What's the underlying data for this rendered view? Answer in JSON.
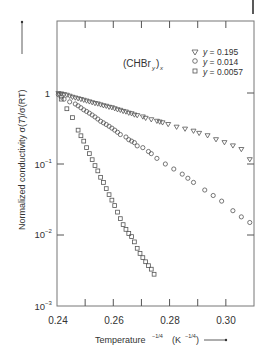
{
  "chart_data": {
    "type": "scatter",
    "title": "",
    "annotation": "(CHBr_y)_x",
    "xlabel": "Temperature^-1/4  (K^-1/4)",
    "ylabel": "Normalized conductivity σ(T)/σ(RT)",
    "xlim": [
      0.24,
      0.31
    ],
    "ylim": [
      0.001,
      3
    ],
    "yscale": "log",
    "x_ticks": [
      0.24,
      0.26,
      0.28,
      0.3
    ],
    "x_tick_labels": [
      "0.24",
      "0.26",
      "0.28",
      "0.30"
    ],
    "y_ticks": [
      1,
      0.1,
      0.01,
      0.001
    ],
    "y_tick_labels": [
      "1",
      "10⁻¹",
      "10⁻²",
      "10⁻³"
    ],
    "grid": false,
    "legend_position": "upper right",
    "series": [
      {
        "name": "y = 0.195",
        "marker": "triangle-down",
        "x": [
          0.2405,
          0.2415,
          0.2425,
          0.2435,
          0.2445,
          0.2455,
          0.2465,
          0.2475,
          0.2485,
          0.2495,
          0.2505,
          0.2515,
          0.2525,
          0.2535,
          0.2545,
          0.2555,
          0.2565,
          0.2575,
          0.2585,
          0.2595,
          0.2605,
          0.2615,
          0.2625,
          0.2635,
          0.2645,
          0.2655,
          0.2665,
          0.2675,
          0.2685,
          0.2705,
          0.2715,
          0.2735,
          0.2755,
          0.2765,
          0.2775,
          0.2795,
          0.2825,
          0.2855,
          0.2885,
          0.2905,
          0.2935,
          0.2965,
          0.2995,
          0.3025,
          0.3055,
          0.3085
        ],
        "y": [
          0.98,
          0.97,
          0.95,
          0.93,
          0.9,
          0.87,
          0.85,
          0.83,
          0.81,
          0.79,
          0.77,
          0.75,
          0.73,
          0.71,
          0.7,
          0.68,
          0.66,
          0.65,
          0.63,
          0.62,
          0.6,
          0.58,
          0.57,
          0.55,
          0.54,
          0.52,
          0.51,
          0.49,
          0.48,
          0.46,
          0.44,
          0.42,
          0.4,
          0.39,
          0.38,
          0.36,
          0.33,
          0.31,
          0.29,
          0.27,
          0.25,
          0.22,
          0.2,
          0.18,
          0.16,
          0.115
        ]
      },
      {
        "name": "y = 0.014",
        "marker": "circle",
        "x": [
          0.2405,
          0.2415,
          0.2425,
          0.2445,
          0.2465,
          0.2475,
          0.2485,
          0.2495,
          0.2505,
          0.2515,
          0.2525,
          0.2535,
          0.2545,
          0.2555,
          0.2565,
          0.2575,
          0.2585,
          0.2595,
          0.2605,
          0.2615,
          0.2625,
          0.2645,
          0.2655,
          0.2665,
          0.2675,
          0.2685,
          0.2705,
          0.2725,
          0.2735,
          0.2755,
          0.2785,
          0.2815,
          0.2845,
          0.2865,
          0.2885,
          0.2925,
          0.2955,
          0.2985,
          0.3025,
          0.3055,
          0.3085
        ],
        "y": [
          0.95,
          0.88,
          0.82,
          0.75,
          0.7,
          0.66,
          0.62,
          0.58,
          0.55,
          0.52,
          0.49,
          0.46,
          0.43,
          0.4,
          0.38,
          0.36,
          0.34,
          0.32,
          0.3,
          0.28,
          0.26,
          0.24,
          0.22,
          0.21,
          0.2,
          0.18,
          0.17,
          0.15,
          0.14,
          0.12,
          0.1,
          0.085,
          0.072,
          0.063,
          0.055,
          0.043,
          0.036,
          0.03,
          0.022,
          0.018,
          0.015
        ]
      },
      {
        "name": "y = 0.0057",
        "marker": "square",
        "x": [
          0.2415,
          0.2435,
          0.2455,
          0.2475,
          0.2485,
          0.2495,
          0.2505,
          0.2515,
          0.2525,
          0.2535,
          0.2545,
          0.2555,
          0.2565,
          0.2575,
          0.2585,
          0.2595,
          0.2605,
          0.2615,
          0.2625,
          0.2635,
          0.2645,
          0.2655,
          0.2665,
          0.2675,
          0.2685,
          0.2695,
          0.2705,
          0.2715,
          0.2725,
          0.2735,
          0.2745
        ],
        "y": [
          0.82,
          0.6,
          0.45,
          0.3,
          0.25,
          0.21,
          0.17,
          0.14,
          0.115,
          0.095,
          0.08,
          0.065,
          0.055,
          0.045,
          0.037,
          0.031,
          0.026,
          0.021,
          0.017,
          0.014,
          0.012,
          0.0105,
          0.0095,
          0.008,
          0.0065,
          0.0055,
          0.0048,
          0.0042,
          0.0037,
          0.0033,
          0.0028
        ]
      }
    ]
  },
  "labels": {
    "annotation_main": "(CHBr",
    "annotation_sub_y": "y",
    "annotation_close": ")",
    "annotation_sub_x": "x",
    "legend_prefix": "y",
    "legend_0": " = 0.195",
    "legend_1": " = 0.014",
    "legend_2": " = 0.0057",
    "xlabel_main": "Temperature",
    "xlabel_sup": "−1/4",
    "xlabel_unit": "(K",
    "xlabel_unit_sup": "−1/4",
    "xlabel_unit_close": ")",
    "ylabel_text": "Normalized conductivity σ(",
    "ylabel_T": "T",
    "ylabel_rest": ")/σ(RT)",
    "yt_1": "1",
    "yt_m1_base": "10",
    "yt_m1_exp": "−1",
    "yt_m2_base": "10",
    "yt_m2_exp": "−2",
    "yt_m3_base": "10",
    "yt_m3_exp": "−3",
    "xt_0": "0.24",
    "xt_1": "0.26",
    "xt_2": "0.28",
    "xt_3": "0.30"
  },
  "colors": {
    "axis": "#555555",
    "marker": "#555555",
    "text": "#333333"
  }
}
